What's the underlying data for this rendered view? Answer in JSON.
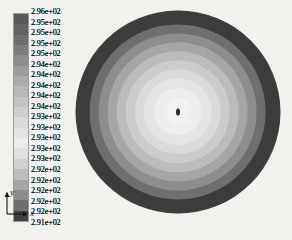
{
  "legend": {
    "title": "temperature-contour-legend",
    "tick_labels": [
      "2.96e+02",
      "2.95e+02",
      "2.95e+02",
      "2.95e+02",
      "2.95e+02",
      "2.94e+02",
      "2.94e+02",
      "2.94e+02",
      "2.94e+02",
      "2.94e+02",
      "2.93e+02",
      "2.93e+02",
      "2.93e+02",
      "2.93e+02",
      "2.93e+02",
      "2.92e+02",
      "2.92e+02",
      "2.92e+02",
      "2.92e+02",
      "2.92e+02",
      "2.91e+02"
    ],
    "band_colors": [
      "#585858",
      "#636363",
      "#6e6e6e",
      "#7d7d7d",
      "#8d8d8d",
      "#9d9d9d",
      "#ababab",
      "#b8b8b8",
      "#c4c4c4",
      "#cfcfcf",
      "#dadada",
      "#e3e3e3",
      "#ebebeb",
      "#e0e0e0",
      "#d0d0d0",
      "#bdbdbd",
      "#a6a6a6",
      "#8c8c8c",
      "#6f6f6f",
      "#414141"
    ]
  },
  "axis_triad": {
    "x_label": "x",
    "y_label": "y",
    "z_label": "z"
  },
  "chart_data": {
    "type": "heatmap",
    "title": "",
    "subtitle": "",
    "xlabel": "x",
    "ylabel": "y",
    "zlabel": "z",
    "grid": false,
    "legend_position": "left",
    "colormap": "grayscale",
    "value_unit": "K",
    "value_min": "2.91e+02",
    "value_max": "2.96e+02",
    "n_contour_bands": 20,
    "geometry": "circular-cross-section",
    "center_x": 177,
    "center_y": 111,
    "outer_radius": 102,
    "rings": [
      {
        "label": "2.96e+02",
        "value": 296.0,
        "radius_px": 102,
        "color": "#3c3c3c"
      },
      {
        "label": "2.95e+02",
        "value": 295.2,
        "radius_px": 88,
        "color": "#6f6f6f"
      },
      {
        "label": "2.95e+02",
        "value": 294.8,
        "radius_px": 79,
        "color": "#8d8d8d"
      },
      {
        "label": "2.94e+02",
        "value": 294.4,
        "radius_px": 70,
        "color": "#a6a6a6"
      },
      {
        "label": "2.94e+02",
        "value": 294.0,
        "radius_px": 61,
        "color": "#bbbbbb"
      },
      {
        "label": "2.93e+02",
        "value": 293.6,
        "radius_px": 52,
        "color": "#cccccc"
      },
      {
        "label": "2.93e+02",
        "value": 293.2,
        "radius_px": 43,
        "color": "#dadada"
      },
      {
        "label": "2.92e+02",
        "value": 292.8,
        "radius_px": 34,
        "color": "#e4e4e4"
      },
      {
        "label": "2.92e+02",
        "value": 292.4,
        "radius_px": 24,
        "color": "#ededed"
      },
      {
        "label": "2.91e+02",
        "value": 292.0,
        "radius_px": 14,
        "color": "#f2f2f2"
      },
      {
        "label": "2.91e+02",
        "value": 291.0,
        "radius_px": 4,
        "color": "#2a2a2a"
      }
    ]
  },
  "colors": {
    "background": "#f2f1ee",
    "text": "#111111",
    "legend_border": "#9a9a9a"
  }
}
